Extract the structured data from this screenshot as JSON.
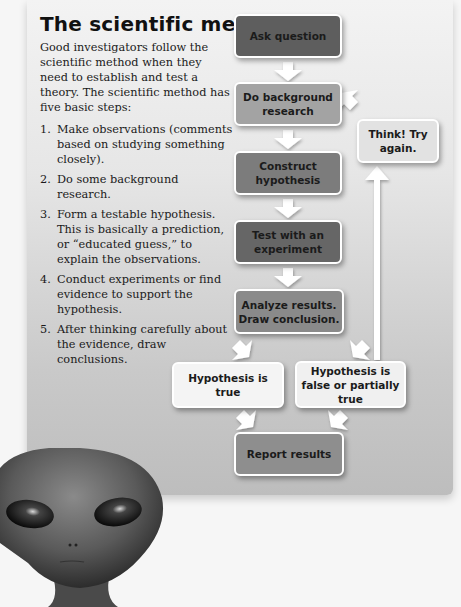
{
  "title": "The scientific method",
  "intro": "Good investigators follow the scientific method when they need to establish and test a theory. The scientific method has five basic steps:",
  "steps": [
    {
      "num": "1.",
      "text": "Make observations (comments based on studying something closely)."
    },
    {
      "num": "2.",
      "text": "Do some background research."
    },
    {
      "num": "3.",
      "text": "Form a testable hypothesis. This is basically a prediction, or “educated guess,” to explain the observations."
    },
    {
      "num": "4.",
      "text": "Conduct experiments or find evidence to support the hypothesis."
    },
    {
      "num": "5.",
      "text": "After thinking carefully about the evidence, draw conclusions."
    }
  ],
  "flowchart": {
    "ask_question": "Ask question",
    "background_research": "Do background research",
    "construct_hypothesis": "Construct hypothesis",
    "test_experiment": "Test with an experiment",
    "analyze_results": "Analyze results. Draw conclusion.",
    "hypothesis_true": "Hypothesis is true",
    "hypothesis_false": "Hypothesis is false or partially true",
    "report_results": "Report results",
    "think_again": "Think! Try again."
  },
  "colors": {
    "box_darkest": "#5e5e5e",
    "box_dark": "#6f6f6f",
    "box_mid": "#8a8a8a",
    "box_light": "#a3a3a3",
    "box_white": "#f4f4f4",
    "box_think": "#e2e2e2"
  },
  "illustration": "alien-head"
}
